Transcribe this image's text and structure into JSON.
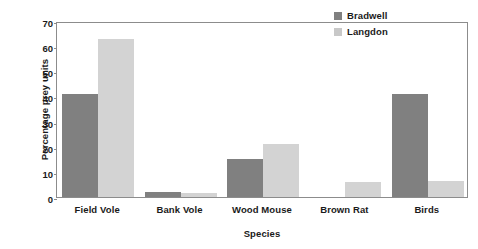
{
  "chart_data": {
    "type": "bar",
    "title": "",
    "xlabel": "Species",
    "ylabel": "Percentage prey units",
    "categories": [
      "Field Vole",
      "Bank Vole",
      "Wood Mouse",
      "Brown Rat",
      "Birds"
    ],
    "series": [
      {
        "name": "Bradwell",
        "color": "#808080",
        "values": [
          41,
          2,
          15,
          0,
          41
        ]
      },
      {
        "name": "Langdon",
        "color": "#d3d3d3",
        "values": [
          63,
          1.5,
          21,
          6,
          6.5
        ]
      }
    ],
    "ylim": [
      0,
      70
    ],
    "yticks": [
      0,
      10,
      20,
      30,
      40,
      50,
      60,
      70
    ],
    "ytick_labels": [
      "0",
      "10",
      "20",
      "30",
      "40",
      "50",
      "60",
      "70"
    ],
    "grid": false,
    "legend_position": "top-right-inside"
  }
}
